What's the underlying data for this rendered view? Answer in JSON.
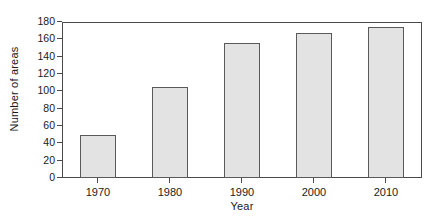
{
  "chart_data": {
    "type": "bar",
    "title": "",
    "xlabel": "Year",
    "ylabel": "Number of areas",
    "categories": [
      "1970",
      "1980",
      "1990",
      "2000",
      "2010"
    ],
    "values": [
      50,
      105,
      156,
      167,
      174
    ],
    "ylim": [
      0,
      180
    ],
    "yticks": [
      0,
      20,
      40,
      60,
      80,
      100,
      120,
      140,
      160,
      180
    ],
    "ytick_labels": [
      "0",
      "20",
      "40",
      "60",
      "80",
      "100",
      "120",
      "140",
      "160",
      "180"
    ],
    "grid": false,
    "legend": null,
    "bar_fill_color": "#e3e3e3",
    "bar_edge_color": "#5a5a5a",
    "axis_color": "#4a4a4a",
    "background_color": "#ffffff"
  }
}
